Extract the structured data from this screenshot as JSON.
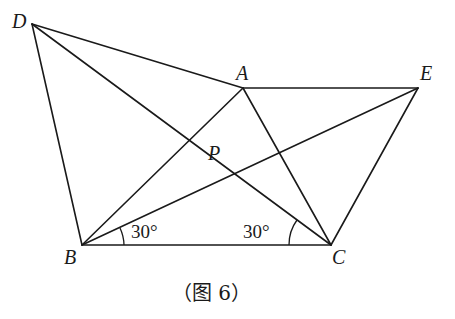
{
  "diagram": {
    "points": {
      "D": {
        "label": "D",
        "x": 32,
        "y": 24
      },
      "A": {
        "label": "A",
        "x": 243,
        "y": 88
      },
      "E": {
        "label": "E",
        "x": 418,
        "y": 88
      },
      "P": {
        "label": "P",
        "x": 207,
        "y": 170
      },
      "B": {
        "label": "B",
        "x": 82,
        "y": 245
      },
      "C": {
        "label": "C",
        "x": 331,
        "y": 245
      }
    },
    "segments": [
      "DA",
      "DB",
      "DC",
      "AE",
      "AB",
      "AC",
      "EB",
      "EC",
      "BC"
    ],
    "angles": {
      "B": {
        "label": "30°",
        "description": "angle between BC and BP/BE"
      },
      "C": {
        "label": "30°",
        "description": "angle between CB and CD"
      }
    },
    "caption": "（图 6）"
  }
}
